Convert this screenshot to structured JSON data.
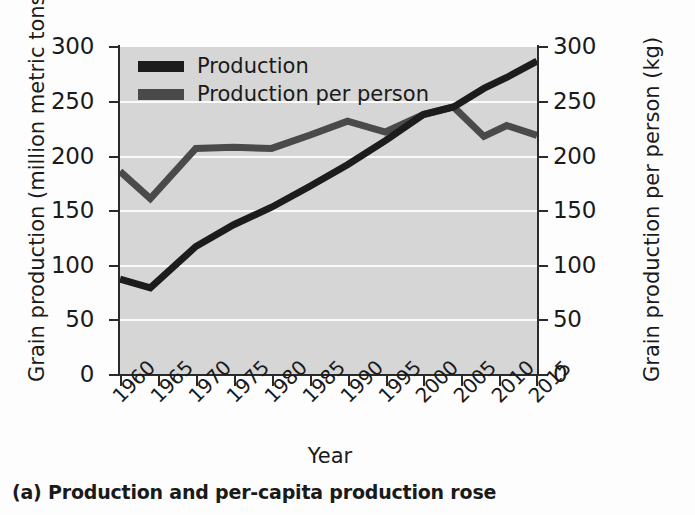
{
  "caption": "(a) Production and per-capita production rose",
  "axes": {
    "xlabel": "Year",
    "ylabel_left": "Grain production (million metric tons)",
    "ylabel_right": "Grain production per person (kg)",
    "yticks": [
      0,
      50,
      100,
      150,
      200,
      250,
      300
    ],
    "xticks": [
      "1960",
      "1965",
      "1970",
      "1975",
      "1980",
      "1985",
      "1990",
      "1995",
      "2000",
      "2005",
      "2010",
      "2015"
    ]
  },
  "legend": {
    "position": "top-left",
    "items": [
      {
        "label": "Production",
        "color": "#1c1c1c"
      },
      {
        "label": "Production per person",
        "color": "#4a4a4a"
      }
    ]
  },
  "colors": {
    "plot_background": "#d6d6d6",
    "gridline": "#fbfbfb",
    "axis": "#2b2b2b",
    "page_background": "#fdfdfd"
  },
  "chart_data": {
    "type": "line",
    "title": "(a) Production and per-capita production rose",
    "xlabel": "Year",
    "ylabel": "Grain production (million metric tons)",
    "ylabel_secondary": "Grain production per person (kg)",
    "xlim": [
      1960,
      2015
    ],
    "ylim": [
      0,
      300
    ],
    "ylim_secondary": [
      0,
      300
    ],
    "grid": true,
    "legend_position": "upper left",
    "x": [
      1960,
      1964,
      1970,
      1975,
      1980,
      1985,
      1990,
      1995,
      2000,
      2004,
      2008,
      2011,
      2015
    ],
    "series": [
      {
        "name": "Production",
        "axis": "left",
        "units": "million metric tons",
        "color": "#1c1c1c",
        "values": [
          87,
          79,
          117,
          137,
          153,
          172,
          192,
          214,
          238,
          245,
          262,
          272,
          287
        ]
      },
      {
        "name": "Production per person",
        "axis": "right",
        "units": "kg",
        "color": "#4a4a4a",
        "values": [
          186,
          161,
          207,
          208,
          207,
          219,
          232,
          222,
          238,
          245,
          218,
          228,
          219
        ]
      }
    ]
  }
}
